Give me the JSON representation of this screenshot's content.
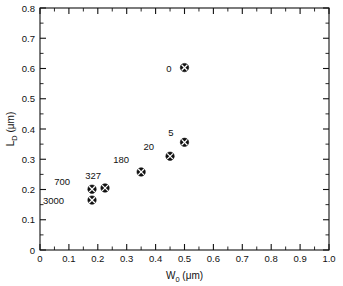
{
  "chart_data": {
    "type": "scatter",
    "title": "",
    "xlabel": "W0  (μm)",
    "xlabel_base": "W",
    "xlabel_sub": "0",
    "xlabel_unit": "(μm)",
    "ylabel": "LD  (μm)",
    "ylabel_base": "L",
    "ylabel_sub": "D",
    "ylabel_unit": "(μm)",
    "xlim": [
      0,
      1.0
    ],
    "ylim": [
      0,
      0.8
    ],
    "grid": false,
    "legend": "none",
    "marker_style": "circled-x",
    "marker_color": "#111111",
    "xticks": [
      0,
      0.1,
      0.2,
      0.3,
      0.4,
      0.5,
      0.6,
      0.7,
      0.8,
      0.9,
      1.0
    ],
    "xticklabels": [
      "0",
      "0.1",
      "0.2",
      "0.3",
      "0.4",
      "0.5",
      "0.6",
      "0.7",
      "0.8",
      "0.9",
      "1.0"
    ],
    "yticks": [
      0,
      0.1,
      0.2,
      0.3,
      0.4,
      0.5,
      0.6,
      0.7,
      0.8
    ],
    "yticklabels": [
      "0",
      "0.1",
      "0.2",
      "0.3",
      "0.4",
      "0.5",
      "0.6",
      "0.7",
      "0.8"
    ],
    "x_minor_step": 0.05,
    "y_minor_step": 0.05,
    "points": [
      {
        "label": "0",
        "x": 0.5,
        "y": 0.603,
        "label_dx": -13,
        "label_dy": 4
      },
      {
        "label": "5",
        "x": 0.5,
        "y": 0.356,
        "label_dx": -11,
        "label_dy": -6
      },
      {
        "label": "20",
        "x": 0.45,
        "y": 0.31,
        "label_dx": -16,
        "label_dy": -6
      },
      {
        "label": "180",
        "x": 0.35,
        "y": 0.258,
        "label_dx": -12,
        "label_dy": -9
      },
      {
        "label": "327",
        "x": 0.225,
        "y": 0.205,
        "label_dx": -4,
        "label_dy": -9
      },
      {
        "label": "700",
        "x": 0.18,
        "y": 0.201,
        "label_dx": -22,
        "label_dy": -4
      },
      {
        "label": "3000",
        "x": 0.18,
        "y": 0.165,
        "label_dx": -28,
        "label_dy": 4
      }
    ]
  },
  "plot_box": {
    "left": 40,
    "right": 329,
    "top": 8,
    "bottom": 250
  }
}
